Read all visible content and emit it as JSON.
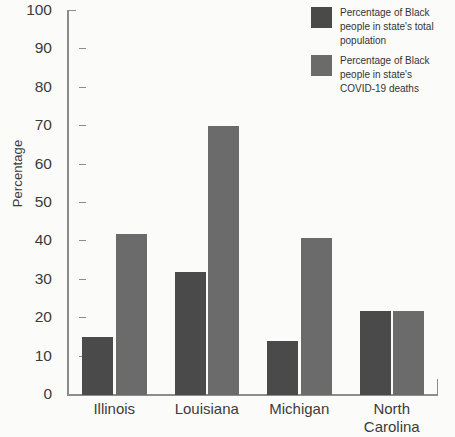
{
  "chart_data": {
    "type": "bar",
    "title": "",
    "subtitle": "",
    "xlabel": "",
    "ylabel": "Percentage",
    "ylim": [
      0,
      100
    ],
    "ytick_step": 10,
    "yticks": [
      100,
      90,
      80,
      70,
      60,
      50,
      40,
      30,
      20,
      10,
      0
    ],
    "grid": false,
    "legend_position": "top-right",
    "categories": [
      "Illinois",
      "Louisiana",
      "Michigan",
      "North Carolina"
    ],
    "category_label_lines": [
      [
        "Illinois"
      ],
      [
        "Louisiana"
      ],
      [
        "Michigan"
      ],
      [
        "North",
        "Carolina"
      ]
    ],
    "series": [
      {
        "name": "Percentage of Black people in state's total population",
        "legend_lines": [
          "Percentage of Black",
          "people in state's total",
          "population"
        ],
        "color": "#4a4a4a",
        "values": [
          15,
          32,
          14,
          22
        ]
      },
      {
        "name": "Percentage of Black people in state's COVID-19 deaths",
        "legend_lines": [
          "Percentage of Black",
          "people in state's",
          "COVID-19 deaths"
        ],
        "color": "#6b6b6b",
        "values": [
          42,
          70,
          41,
          22
        ]
      }
    ]
  },
  "axis": {
    "y_title": "Percentage",
    "y_tick_labels": [
      "100",
      "90",
      "80",
      "70",
      "60",
      "50",
      "40",
      "30",
      "20",
      "10",
      "0"
    ]
  },
  "legend": {
    "items": [
      {
        "swatch_color": "#4a4a4a",
        "line1": "Percentage of Black",
        "line2": "people in state's total",
        "line3": "population"
      },
      {
        "swatch_color": "#6b6b6b",
        "line1": "Percentage of Black",
        "line2": "people in state's",
        "line3": "COVID-19 deaths"
      }
    ]
  },
  "x_labels": [
    {
      "line1": "Illinois",
      "line2": ""
    },
    {
      "line1": "Louisiana",
      "line2": ""
    },
    {
      "line1": "Michigan",
      "line2": ""
    },
    {
      "line1": "North",
      "line2": "Carolina"
    }
  ]
}
